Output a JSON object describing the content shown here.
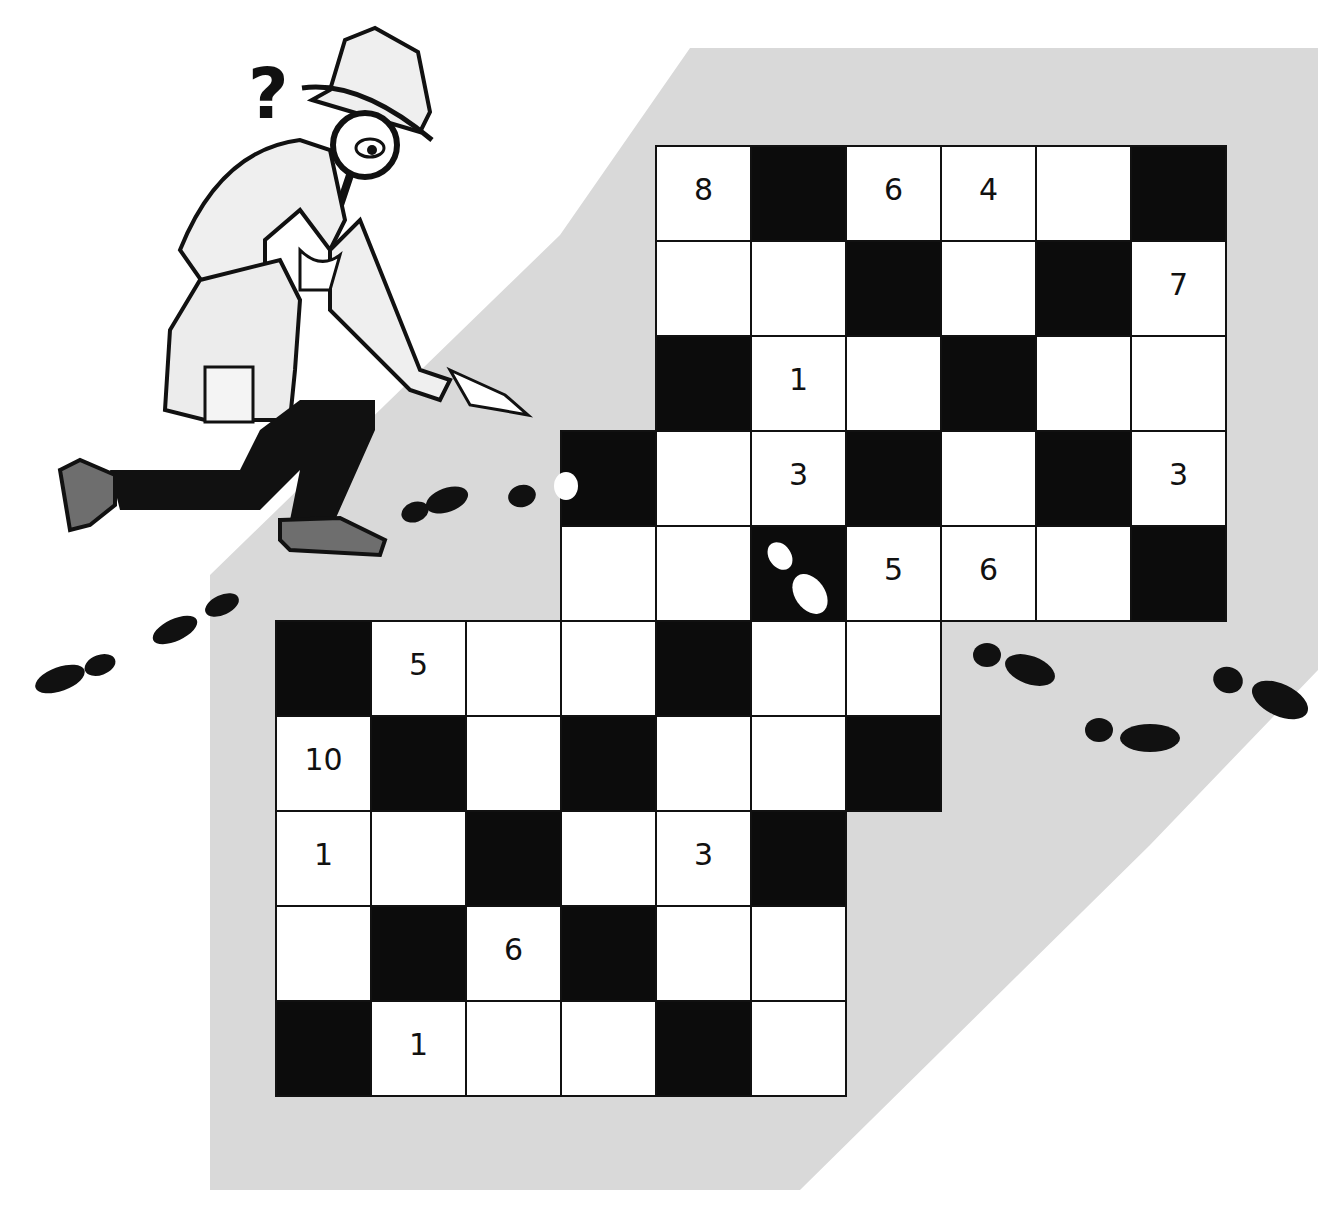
{
  "puzzle": {
    "type": "number-crossword",
    "cell_size": 95,
    "origin": {
      "x": 275,
      "y": 145
    },
    "rows": [
      {
        "row": 0,
        "cells": [
          {
            "col": 4,
            "type": "white",
            "num": "8"
          },
          {
            "col": 5,
            "type": "black"
          },
          {
            "col": 6,
            "type": "white",
            "num": "6"
          },
          {
            "col": 7,
            "type": "white",
            "num": "4"
          },
          {
            "col": 8,
            "type": "white"
          },
          {
            "col": 9,
            "type": "black"
          }
        ]
      },
      {
        "row": 1,
        "cells": [
          {
            "col": 4,
            "type": "white"
          },
          {
            "col": 5,
            "type": "white"
          },
          {
            "col": 6,
            "type": "black"
          },
          {
            "col": 7,
            "type": "white"
          },
          {
            "col": 8,
            "type": "black"
          },
          {
            "col": 9,
            "type": "white",
            "num": "7"
          }
        ]
      },
      {
        "row": 2,
        "cells": [
          {
            "col": 4,
            "type": "black"
          },
          {
            "col": 5,
            "type": "white",
            "num": "1"
          },
          {
            "col": 6,
            "type": "white"
          },
          {
            "col": 7,
            "type": "black"
          },
          {
            "col": 8,
            "type": "white"
          },
          {
            "col": 9,
            "type": "white"
          }
        ]
      },
      {
        "row": 3,
        "cells": [
          {
            "col": 3,
            "type": "black"
          },
          {
            "col": 4,
            "type": "white"
          },
          {
            "col": 5,
            "type": "white",
            "num": "3"
          },
          {
            "col": 6,
            "type": "black"
          },
          {
            "col": 7,
            "type": "white"
          },
          {
            "col": 8,
            "type": "black"
          },
          {
            "col": 9,
            "type": "white",
            "num": "3"
          }
        ]
      },
      {
        "row": 4,
        "cells": [
          {
            "col": 3,
            "type": "white"
          },
          {
            "col": 4,
            "type": "white"
          },
          {
            "col": 5,
            "type": "black",
            "footprint": true
          },
          {
            "col": 6,
            "type": "white",
            "num": "5"
          },
          {
            "col": 7,
            "type": "white",
            "num": "6"
          },
          {
            "col": 8,
            "type": "white"
          },
          {
            "col": 9,
            "type": "black"
          }
        ]
      },
      {
        "row": 5,
        "cells": [
          {
            "col": 0,
            "type": "black"
          },
          {
            "col": 1,
            "type": "white",
            "num": "5"
          },
          {
            "col": 2,
            "type": "white"
          },
          {
            "col": 3,
            "type": "white"
          },
          {
            "col": 4,
            "type": "black"
          },
          {
            "col": 5,
            "type": "white"
          },
          {
            "col": 6,
            "type": "white"
          }
        ]
      },
      {
        "row": 6,
        "cells": [
          {
            "col": 0,
            "type": "white",
            "num": "10"
          },
          {
            "col": 1,
            "type": "black"
          },
          {
            "col": 2,
            "type": "white"
          },
          {
            "col": 3,
            "type": "black"
          },
          {
            "col": 4,
            "type": "white"
          },
          {
            "col": 5,
            "type": "white"
          },
          {
            "col": 6,
            "type": "black"
          }
        ]
      },
      {
        "row": 7,
        "cells": [
          {
            "col": 0,
            "type": "white",
            "num": "1"
          },
          {
            "col": 1,
            "type": "white"
          },
          {
            "col": 2,
            "type": "black"
          },
          {
            "col": 3,
            "type": "white"
          },
          {
            "col": 4,
            "type": "white",
            "num": "3"
          },
          {
            "col": 5,
            "type": "black"
          }
        ]
      },
      {
        "row": 8,
        "cells": [
          {
            "col": 0,
            "type": "white"
          },
          {
            "col": 1,
            "type": "black"
          },
          {
            "col": 2,
            "type": "white",
            "num": "6"
          },
          {
            "col": 3,
            "type": "black"
          },
          {
            "col": 4,
            "type": "white"
          },
          {
            "col": 5,
            "type": "white"
          }
        ]
      },
      {
        "row": 9,
        "cells": [
          {
            "col": 0,
            "type": "black"
          },
          {
            "col": 1,
            "type": "white",
            "num": "1"
          },
          {
            "col": 2,
            "type": "white"
          },
          {
            "col": 3,
            "type": "white"
          },
          {
            "col": 4,
            "type": "black"
          },
          {
            "col": 5,
            "type": "white"
          }
        ]
      }
    ]
  },
  "illustration": {
    "character": "detective-with-magnifying-glass",
    "symbol": "?",
    "footprints": "trail-across-grid"
  },
  "colors": {
    "backdrop": "#d9d9d9",
    "black_cell": "#0c0c0c",
    "white_cell": "#ffffff",
    "ink": "#111111",
    "shoe": "#6e6e6e"
  }
}
